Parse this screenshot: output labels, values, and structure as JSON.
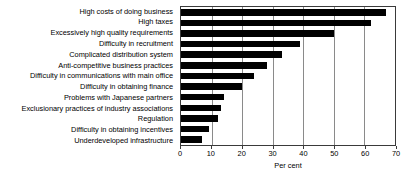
{
  "chart_data": {
    "type": "bar",
    "orientation": "horizontal",
    "title": "",
    "xlabel": "Per cent",
    "ylabel": "",
    "xlim": [
      0,
      70
    ],
    "xticks": [
      0,
      10,
      20,
      30,
      40,
      50,
      60,
      70
    ],
    "grid": true,
    "legend": false,
    "bar_color": "#000000",
    "categories": [
      "High costs of doing business",
      "High taxes",
      "Excessively high quality requirements",
      "Difficulty in recruitment",
      "Complicated distribution system",
      "Anti-competitive business practices",
      "Difficulty in communications with main office",
      "Difficulty in obtaining finance",
      "Problems with Japanese partners",
      "Exclusionary practices of industry associations",
      "Regulation",
      "Difficulty in obtaining incentives",
      "Underdeveloped infrastructure"
    ],
    "values": [
      67,
      62,
      50,
      39,
      33,
      28,
      24,
      20,
      14,
      13,
      12,
      9,
      7
    ]
  }
}
